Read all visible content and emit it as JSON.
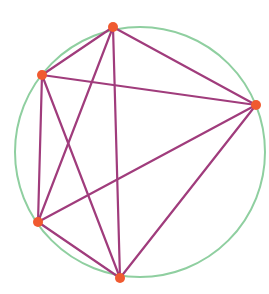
{
  "diagram": {
    "type": "complete-graph-inscribed-in-circle",
    "colors": {
      "background": "#ffffff",
      "circle": "#8fcfa0",
      "edge": "#a03c7c",
      "vertex": "#f05a30"
    },
    "circle": {
      "cx": 140,
      "cy": 152,
      "r": 125,
      "stroke_width": 2
    },
    "edge_width": 2.2,
    "vertex_radius": 5,
    "vertices": [
      {
        "id": "A",
        "label": "top",
        "x": 113,
        "y": 27
      },
      {
        "id": "B",
        "label": "upper-left",
        "x": 42,
        "y": 75
      },
      {
        "id": "C",
        "label": "right",
        "x": 256,
        "y": 105
      },
      {
        "id": "D",
        "label": "lower-left",
        "x": 38,
        "y": 222
      },
      {
        "id": "E",
        "label": "bottom",
        "x": 120,
        "y": 278
      }
    ],
    "edges": [
      [
        "A",
        "B"
      ],
      [
        "A",
        "C"
      ],
      [
        "A",
        "D"
      ],
      [
        "A",
        "E"
      ],
      [
        "B",
        "C"
      ],
      [
        "B",
        "D"
      ],
      [
        "B",
        "E"
      ],
      [
        "C",
        "D"
      ],
      [
        "C",
        "E"
      ],
      [
        "D",
        "E"
      ]
    ]
  }
}
